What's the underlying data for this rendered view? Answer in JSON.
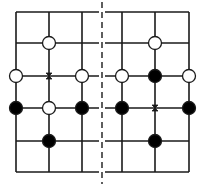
{
  "diagram": {
    "type": "go-board-comparison",
    "panels": [
      {
        "name": "left",
        "stones": [
          {
            "color": "white",
            "x": 49,
            "y": 43
          },
          {
            "color": "white",
            "x": 16,
            "y": 76
          },
          {
            "color": "white",
            "x": 82,
            "y": 76
          },
          {
            "color": "black",
            "x": 16,
            "y": 108
          },
          {
            "color": "white",
            "x": 49,
            "y": 108
          },
          {
            "color": "black",
            "x": 82,
            "y": 108
          },
          {
            "color": "black",
            "x": 49,
            "y": 141
          }
        ],
        "markers": [
          {
            "type": "x-mark",
            "x": 49,
            "y": 76
          }
        ]
      },
      {
        "name": "right",
        "stones": [
          {
            "color": "white",
            "x": 155,
            "y": 43
          },
          {
            "color": "white",
            "x": 122,
            "y": 76
          },
          {
            "color": "black",
            "x": 155,
            "y": 76
          },
          {
            "color": "white",
            "x": 189,
            "y": 76
          },
          {
            "color": "black",
            "x": 122,
            "y": 108
          },
          {
            "color": "black",
            "x": 189,
            "y": 108
          },
          {
            "color": "black",
            "x": 155,
            "y": 141
          }
        ],
        "markers": [
          {
            "type": "x-mark",
            "x": 155,
            "y": 108
          }
        ]
      }
    ],
    "divider": {
      "style": "dashed",
      "x": 102
    },
    "colors": {
      "line": "#1a1a1a",
      "black_stone": "#000000",
      "white_stone": "#ffffff"
    }
  }
}
